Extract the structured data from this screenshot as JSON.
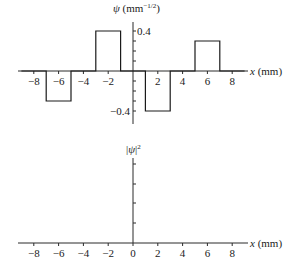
{
  "chart_data": [
    {
      "type": "line",
      "subtype": "step",
      "title": "",
      "ylabel": "ψ (mm^-1/2)",
      "ylabel_main": "ψ (mm",
      "ylabel_sup": "−1/2",
      "ylabel_close": ")",
      "xlabel": "x (mm)",
      "xlabel_italic": "x",
      "xlabel_unit": " (mm)",
      "xlim": [
        -9,
        9
      ],
      "ylim": [
        -0.5,
        0.5
      ],
      "xticks": [
        -8,
        -6,
        -4,
        -2,
        2,
        4,
        6,
        8
      ],
      "xtick_labels": [
        "−8",
        "−6",
        "−4",
        "−2",
        "2",
        "4",
        "6",
        "8"
      ],
      "yticks_minor": [
        -0.4,
        -0.3,
        -0.2,
        -0.1,
        0.1,
        0.2,
        0.3,
        0.4
      ],
      "ytick_labels": [
        {
          "value": 0.4,
          "label": "0.4"
        },
        {
          "value": -0.4,
          "label": "−0.4"
        }
      ],
      "grid": false,
      "segments": [
        {
          "x_start": -9,
          "x_end": -7,
          "value": 0
        },
        {
          "x_start": -7,
          "x_end": -5,
          "value": -0.3
        },
        {
          "x_start": -5,
          "x_end": -3,
          "value": 0
        },
        {
          "x_start": -3,
          "x_end": -1,
          "value": 0.4
        },
        {
          "x_start": -1,
          "x_end": 1,
          "value": 0
        },
        {
          "x_start": 1,
          "x_end": 3,
          "value": -0.4
        },
        {
          "x_start": 3,
          "x_end": 5,
          "value": 0
        },
        {
          "x_start": 5,
          "x_end": 7,
          "value": 0.3
        },
        {
          "x_start": 7,
          "x_end": 9,
          "value": 0
        }
      ]
    },
    {
      "type": "line",
      "title": "",
      "ylabel": "|ψ|²",
      "ylabel_main": "|ψ|",
      "ylabel_sup": "2",
      "xlabel": "x (mm)",
      "xlabel_italic": "x",
      "xlabel_unit": " (mm)",
      "xlim": [
        -9,
        9
      ],
      "xticks": [
        -8,
        -6,
        -4,
        -2,
        0,
        2,
        4,
        6,
        8
      ],
      "xtick_labels": [
        "−8",
        "−6",
        "−4",
        "−2",
        "0",
        "2",
        "4",
        "6",
        "8"
      ],
      "yticks_minor_count": 4,
      "grid": false,
      "segments": [],
      "note": "empty axes (to be filled in)"
    }
  ]
}
